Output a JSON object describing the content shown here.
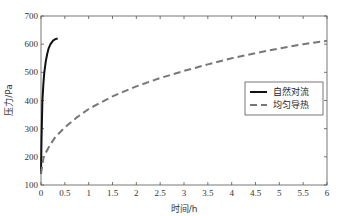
{
  "chart_data": {
    "type": "line",
    "title": "",
    "xlabel": "时间/h",
    "ylabel": "压力/Pa",
    "xlim": [
      0,
      6
    ],
    "ylim": [
      100,
      700
    ],
    "xticks": [
      "0",
      "0.5",
      "1",
      "1.5",
      "2",
      "2.5",
      "3",
      "3.5",
      "4",
      "4.5",
      "5",
      "5.5",
      "6"
    ],
    "yticks": [
      "100",
      "200",
      "300",
      "400",
      "500",
      "600",
      "700"
    ],
    "grid": false,
    "legend_position": "center-right",
    "series": [
      {
        "name": "自然对流",
        "style": "solid",
        "color": "#111111",
        "x": [
          0,
          0.01,
          0.02,
          0.03,
          0.05,
          0.07,
          0.1,
          0.13,
          0.16,
          0.2,
          0.25,
          0.3,
          0.35
        ],
        "y": [
          140,
          260,
          340,
          400,
          460,
          500,
          540,
          565,
          585,
          600,
          612,
          618,
          620
        ]
      },
      {
        "name": "均匀导热",
        "style": "dashed",
        "color": "#777777",
        "x": [
          0,
          0.05,
          0.1,
          0.2,
          0.3,
          0.5,
          0.75,
          1,
          1.5,
          2,
          2.5,
          3,
          3.5,
          4,
          4.5,
          5,
          5.5,
          6
        ],
        "y": [
          140,
          195,
          215,
          245,
          270,
          305,
          340,
          370,
          415,
          450,
          480,
          505,
          528,
          550,
          568,
          585,
          600,
          612
        ]
      }
    ]
  }
}
